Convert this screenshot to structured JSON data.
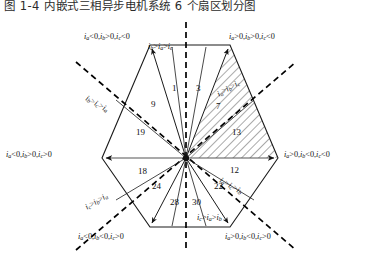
{
  "caption": "图 1-4  内嵌式三相异步电机系统 6 个扇区划分图",
  "diagram": {
    "outer_conditions": [
      {
        "id": "top-left",
        "text": "ia<0,ib>0,ic<0"
      },
      {
        "id": "top-right",
        "text": "ia>0,ib>0,ic<0"
      },
      {
        "id": "left",
        "text": "ia<0,ib>0,ic>0"
      },
      {
        "id": "right",
        "text": "ia>0,ib<0,ic<0"
      },
      {
        "id": "bottom-left",
        "text": "ia<0,ib<0,ic>0"
      },
      {
        "id": "bottom-right",
        "text": "ia>0,ib<0,ic>0"
      }
    ],
    "inner_orderings": [
      {
        "id": "top",
        "text": "ib>ia>ic"
      },
      {
        "id": "upper-left",
        "text": "ib>ic>ia"
      },
      {
        "id": "upper-right",
        "text": "ia>ib>ic"
      },
      {
        "id": "lower-right",
        "text": "ia>ic>ib"
      },
      {
        "id": "lower-left",
        "text": "ic>ib>ia"
      },
      {
        "id": "bottom",
        "text": "ic>ia>ib"
      }
    ],
    "sector_numbers": [
      {
        "id": "n1",
        "value": "1"
      },
      {
        "id": "n3",
        "value": "3"
      },
      {
        "id": "n9",
        "value": "9"
      },
      {
        "id": "n7",
        "value": "7"
      },
      {
        "id": "n19",
        "value": "19"
      },
      {
        "id": "n13",
        "value": "13"
      },
      {
        "id": "n18",
        "value": "18"
      },
      {
        "id": "n12",
        "value": "12"
      },
      {
        "id": "n24",
        "value": "24"
      },
      {
        "id": "n28",
        "value": "28"
      },
      {
        "id": "n30",
        "value": "30"
      },
      {
        "id": "n22",
        "value": "22"
      }
    ],
    "colors": {
      "line": "#1a1a1a",
      "dashed": "#000000",
      "hatch": "#3a3a3a",
      "text": "#111111",
      "background": "#ffffff"
    },
    "hatched_region_label": "sector-1-hatched"
  }
}
